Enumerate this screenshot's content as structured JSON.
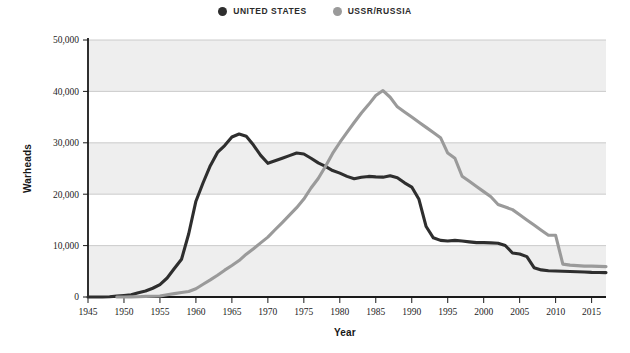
{
  "legend": {
    "position": "top-center",
    "items": [
      {
        "label": "UNITED STATES",
        "color": "#2e2e2e",
        "marker": "circle-dot-icon"
      },
      {
        "label": "USSR/RUSSIA",
        "color": "#9a9a9a",
        "marker": "circle-dot-icon"
      }
    ]
  },
  "chart_data": {
    "type": "line",
    "title": "",
    "subtitle": "",
    "xlabel": "Year",
    "ylabel": "Warheads",
    "xlim": [
      1945,
      2017
    ],
    "ylim": [
      0,
      50000
    ],
    "xticks": [
      1945,
      1950,
      1955,
      1960,
      1965,
      1970,
      1975,
      1980,
      1985,
      1990,
      1995,
      2000,
      2005,
      2010,
      2015
    ],
    "xticklabels": [
      "1945",
      "1950",
      "1955",
      "1960",
      "1965",
      "1970",
      "1975",
      "1980",
      "1985",
      "1990",
      "1995",
      "2000",
      "2005",
      "2010",
      "2015"
    ],
    "yticks": [
      0,
      10000,
      20000,
      30000,
      40000,
      50000
    ],
    "yticklabels": [
      "0",
      "10,000",
      "20,000",
      "30,000",
      "40,000",
      "50,000"
    ],
    "grid": "horizontal",
    "banding": [
      {
        "from": 0,
        "to": 10000,
        "shaded": true
      },
      {
        "from": 10000,
        "to": 20000,
        "shaded": false
      },
      {
        "from": 20000,
        "to": 30000,
        "shaded": true
      },
      {
        "from": 30000,
        "to": 40000,
        "shaded": false
      },
      {
        "from": 40000,
        "to": 50000,
        "shaded": true
      }
    ],
    "series": [
      {
        "name": "UNITED STATES",
        "color": "#2e2e2e",
        "x": [
          1945,
          1946,
          1947,
          1948,
          1949,
          1950,
          1951,
          1952,
          1953,
          1954,
          1955,
          1956,
          1957,
          1958,
          1959,
          1960,
          1961,
          1962,
          1963,
          1964,
          1965,
          1966,
          1967,
          1968,
          1969,
          1970,
          1971,
          1972,
          1973,
          1974,
          1975,
          1976,
          1977,
          1978,
          1979,
          1980,
          1981,
          1982,
          1983,
          1984,
          1985,
          1986,
          1987,
          1988,
          1989,
          1990,
          1991,
          1992,
          1993,
          1994,
          1995,
          1996,
          1997,
          1998,
          1999,
          2000,
          2001,
          2002,
          2003,
          2004,
          2005,
          2006,
          2007,
          2008,
          2009,
          2010,
          2011,
          2012,
          2013,
          2014,
          2015,
          2016,
          2017
        ],
        "y": [
          2,
          9,
          13,
          50,
          170,
          299,
          438,
          841,
          1169,
          1703,
          2422,
          3692,
          5543,
          7345,
          12298,
          18638,
          22229,
          25540,
          28133,
          29463,
          31139,
          31700,
          31255,
          29561,
          27552,
          26008,
          26500,
          27000,
          27500,
          28000,
          27826,
          27000,
          26100,
          25400,
          24600,
          24104,
          23464,
          23000,
          23305,
          23459,
          23368,
          23317,
          23575,
          23205,
          22217,
          21392,
          19008,
          13708,
          11511,
          11012,
          10904,
          11011,
          10903,
          10732,
          10577,
          10577,
          10526,
          10457,
          10027,
          8570,
          8360,
          7853,
          5709,
          5273,
          5113,
          5066,
          5000,
          4950,
          4900,
          4850,
          4800,
          4780,
          4750
        ]
      },
      {
        "name": "USSR/RUSSIA",
        "color": "#9a9a9a",
        "x": [
          1949,
          1950,
          1951,
          1952,
          1953,
          1954,
          1955,
          1956,
          1957,
          1958,
          1959,
          1960,
          1961,
          1962,
          1963,
          1964,
          1965,
          1966,
          1967,
          1968,
          1969,
          1970,
          1971,
          1972,
          1973,
          1974,
          1975,
          1976,
          1977,
          1978,
          1979,
          1980,
          1981,
          1982,
          1983,
          1984,
          1985,
          1986,
          1987,
          1988,
          1989,
          1990,
          1991,
          1992,
          1993,
          1994,
          1995,
          1996,
          1997,
          1998,
          1999,
          2000,
          2001,
          2002,
          2003,
          2004,
          2005,
          2006,
          2007,
          2008,
          2009,
          2010,
          2011,
          2012,
          2013,
          2014,
          2015,
          2016,
          2017
        ],
        "y": [
          1,
          5,
          25,
          50,
          120,
          150,
          200,
          426,
          660,
          869,
          1060,
          1605,
          2471,
          3322,
          4238,
          5221,
          6129,
          7089,
          8339,
          9399,
          10538,
          11643,
          13092,
          14478,
          15915,
          17385,
          19055,
          21205,
          23044,
          25393,
          27935,
          30062,
          32049,
          33952,
          35804,
          37431,
          39197,
          40159,
          38859,
          37000,
          36000,
          35000,
          34000,
          33000,
          32000,
          31000,
          28000,
          27000,
          23500,
          22500,
          21500,
          20500,
          19500,
          18000,
          17500,
          17000,
          16000,
          15000,
          14000,
          13000,
          12000,
          12000,
          6400,
          6200,
          6100,
          6000,
          6000,
          5950,
          5900
        ]
      }
    ]
  }
}
